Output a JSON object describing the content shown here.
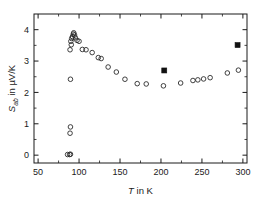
{
  "chart_data": {
    "type": "scatter",
    "title": "",
    "subtitle": "",
    "xlabel": "T in K",
    "xlabel_parts": {
      "symbol": "T",
      "rest": " in K"
    },
    "ylabel": "S_ab in µV/K",
    "ylabel_parts": {
      "symbol": "S",
      "subscript": "ab",
      "rest": " in µV/K"
    },
    "xlim": [
      45,
      305
    ],
    "ylim": [
      -0.25,
      4.5
    ],
    "xticks": [
      50,
      100,
      150,
      200,
      250,
      300
    ],
    "xtick_labels": [
      "50",
      "100",
      "150",
      "200",
      "250",
      "300"
    ],
    "yticks": [
      0,
      1,
      2,
      3,
      4
    ],
    "ytick_labels": [
      "0",
      "1",
      "2",
      "3",
      "4"
    ],
    "x_minor_ticks": [
      75,
      125,
      175,
      225,
      275
    ],
    "y_minor_ticks": [
      0.5,
      1.5,
      2.5,
      3.5
    ],
    "grid": false,
    "legend": "none",
    "tick_direction": "in",
    "frame": "box",
    "series": [
      {
        "name": "open-circles",
        "marker": "open-circle",
        "color": "#2b2b2b",
        "points": [
          [
            86.0,
            0.02
          ],
          [
            88.5,
            0.02
          ],
          [
            89.5,
            0.03
          ],
          [
            89.0,
            0.7
          ],
          [
            89.5,
            0.9
          ],
          [
            89.5,
            2.42
          ],
          [
            89.0,
            3.36
          ],
          [
            90.5,
            3.52
          ],
          [
            90.0,
            3.63
          ],
          [
            91.0,
            3.72
          ],
          [
            92.0,
            3.78
          ],
          [
            93.0,
            3.86
          ],
          [
            93.5,
            3.9
          ],
          [
            94.5,
            3.83
          ],
          [
            95.5,
            3.74
          ],
          [
            97.5,
            3.66
          ],
          [
            100.0,
            3.63
          ],
          [
            104.0,
            3.37
          ],
          [
            108.5,
            3.36
          ],
          [
            116.0,
            3.27
          ],
          [
            123.5,
            3.11
          ],
          [
            127.0,
            3.08
          ],
          [
            135.5,
            2.81
          ],
          [
            145.5,
            2.65
          ],
          [
            156.0,
            2.42
          ],
          [
            171.0,
            2.28
          ],
          [
            182.0,
            2.27
          ],
          [
            203.0,
            2.21
          ],
          [
            224.0,
            2.3
          ],
          [
            239.0,
            2.38
          ],
          [
            245.0,
            2.4
          ],
          [
            252.0,
            2.43
          ],
          [
            260.0,
            2.47
          ],
          [
            281.0,
            2.62
          ],
          [
            294.5,
            2.71
          ]
        ]
      },
      {
        "name": "filled-squares",
        "marker": "filled-square",
        "color": "#111111",
        "points": [
          [
            204.0,
            2.7
          ],
          [
            293.5,
            3.51
          ]
        ]
      }
    ]
  },
  "figure": {
    "background_color": "#ffffff",
    "axis_color": "#1a1a1a",
    "marker_open_color": "#2b2b2b",
    "marker_filled_color": "#111111"
  }
}
